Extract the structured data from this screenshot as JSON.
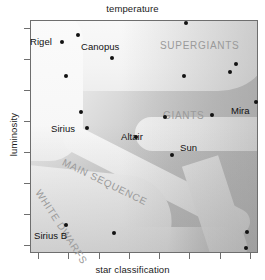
{
  "chart_data": {
    "type": "scatter",
    "title": "",
    "xlabel_top": "temperature",
    "xlabel_bottom": "star classification",
    "ylabel": "luminosity",
    "axis_note": "Hertzsprung-Russell diagram; axes unlabeled with numeric ticks",
    "grid": false,
    "legend": "none",
    "x_ticks": 8,
    "y_ticks": 8,
    "regions": [
      {
        "name": "SUPERGIANTS",
        "label": "SUPERGIANTS"
      },
      {
        "name": "GIANTS",
        "label": "GIANTS"
      },
      {
        "name": "MAIN SEQUENCE",
        "label": "MAIN SEQUENCE"
      },
      {
        "name": "WHITE DWARFS",
        "label": "WHITE DWARFS"
      }
    ],
    "named_stars": [
      {
        "name": "Rigel",
        "x": 62,
        "y": 42,
        "label_x": 30,
        "label_y": 36
      },
      {
        "name": "Canopus",
        "x": 112,
        "y": 58,
        "label_x": 81,
        "label_y": 41
      },
      {
        "name": "Sirius",
        "x": 87,
        "y": 128,
        "label_x": 51,
        "label_y": 123
      },
      {
        "name": "Altair",
        "x": 136,
        "y": 137,
        "label_x": 121,
        "label_y": 131
      },
      {
        "name": "Sun",
        "x": 172,
        "y": 155,
        "label_x": 180,
        "label_y": 142
      },
      {
        "name": "Mira",
        "x": 256,
        "y": 102,
        "label_x": 231,
        "label_y": 105
      },
      {
        "name": "Sirius B",
        "x": 66,
        "y": 225,
        "label_x": 34,
        "label_y": 230
      }
    ],
    "unlabeled_stars": [
      {
        "x": 78,
        "y": 35
      },
      {
        "x": 186,
        "y": 23
      },
      {
        "x": 236,
        "y": 64
      },
      {
        "x": 230,
        "y": 72
      },
      {
        "x": 66,
        "y": 76
      },
      {
        "x": 184,
        "y": 76
      },
      {
        "x": 212,
        "y": 115
      },
      {
        "x": 81,
        "y": 112
      },
      {
        "x": 165,
        "y": 117
      },
      {
        "x": 114,
        "y": 233
      },
      {
        "x": 247,
        "y": 232
      },
      {
        "x": 246,
        "y": 248
      }
    ],
    "colors": {
      "point": "#121212",
      "region_label": "#9a9a9a",
      "axis": "#6e6e6e",
      "text": "#111111",
      "band_light": "#f6f6f6",
      "background_light": "#fdfdfd",
      "background_dark": "#b8b8b8"
    }
  },
  "axes": {
    "top_title": "temperature",
    "bottom_title": "star classification",
    "left_title": "luminosity"
  },
  "regions": {
    "supergiants": "SUPERGIANTS",
    "giants": "GIANTS",
    "main_sequence": "MAIN SEQUENCE",
    "white_dwarfs": "WHITE DWARFS"
  },
  "stars": {
    "rigel": "Rigel",
    "canopus": "Canopus",
    "sirius": "Sirius",
    "altair": "Altair",
    "sun": "Sun",
    "mira": "Mira",
    "sirius_b": "Sirius B"
  }
}
